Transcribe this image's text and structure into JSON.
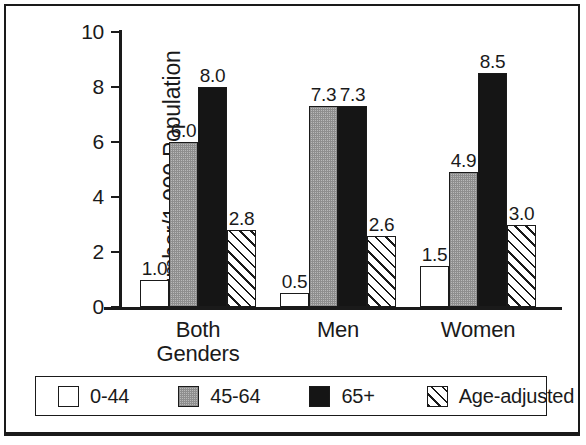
{
  "chart_data": {
    "type": "bar",
    "title": "",
    "xlabel": "",
    "ylabel": "Number/1,000 Population",
    "ylim": [
      0,
      10
    ],
    "yticks": [
      "0",
      "2",
      "4",
      "6",
      "8",
      "10"
    ],
    "grid": false,
    "legend_position": "bottom",
    "categories": [
      "Both Genders",
      "Men",
      "Women"
    ],
    "category_labels": [
      {
        "line1": "Both",
        "line2": "Genders"
      },
      {
        "line1": "Men",
        "line2": ""
      },
      {
        "line1": "Women",
        "line2": ""
      }
    ],
    "series": [
      {
        "name": "0-44",
        "fill": "white",
        "values": [
          1.0,
          0.5,
          1.5
        ],
        "labels": [
          "1.0",
          "0.5",
          "1.5"
        ]
      },
      {
        "name": "45-64",
        "fill": "gray",
        "values": [
          6.0,
          7.3,
          4.9
        ],
        "labels": [
          "6.0",
          "7.3",
          "4.9"
        ]
      },
      {
        "name": "65+",
        "fill": "black",
        "values": [
          8.0,
          7.3,
          8.5
        ],
        "labels": [
          "8.0",
          "7.3",
          "8.5"
        ]
      },
      {
        "name": "Age-adjusted",
        "fill": "hatch",
        "values": [
          2.8,
          2.6,
          3.0
        ],
        "labels": [
          "2.8",
          "2.6",
          "3.0"
        ]
      }
    ],
    "colors": {
      "axis": "#1a1a1a",
      "text": "#1a1a1a",
      "background": "#ffffff",
      "series_white": "#ffffff",
      "series_gray": "#b9b9b9",
      "series_black": "#151515",
      "series_hatch": "#ffffff"
    }
  },
  "legend": {
    "items": [
      {
        "label": "0-44",
        "swatch": "white"
      },
      {
        "label": "45-64",
        "swatch": "gray"
      },
      {
        "label": "65+",
        "swatch": "black"
      },
      {
        "label": "Age-adjusted",
        "swatch": "hatch"
      }
    ]
  },
  "axis": {
    "y_title": "Number/1,000 Population",
    "ticks": [
      {
        "value": 10,
        "label": "10"
      },
      {
        "value": 8,
        "label": "8"
      },
      {
        "value": 6,
        "label": "6"
      },
      {
        "value": 4,
        "label": "4"
      },
      {
        "value": 2,
        "label": "2"
      },
      {
        "value": 0,
        "label": "0"
      }
    ]
  }
}
